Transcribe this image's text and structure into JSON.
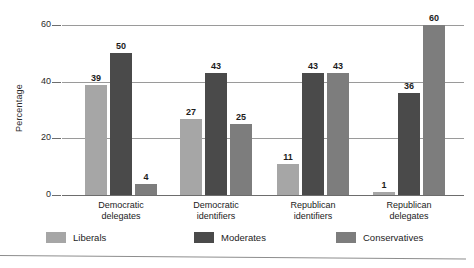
{
  "chart_data": {
    "type": "bar",
    "title": "",
    "xlabel": "",
    "ylabel": "Percentage",
    "ylim": [
      0,
      60
    ],
    "yticks": [
      "0",
      "20",
      "40",
      "60"
    ],
    "ytick_values": [
      0,
      20,
      40,
      60
    ],
    "grid": true,
    "legend_position": "bottom",
    "categories": [
      "Democratic delegates",
      "Democratic identifiers",
      "Republican identifiers",
      "Republican delegates"
    ],
    "category_lines": [
      [
        "Democratic",
        "delegates"
      ],
      [
        "Democratic",
        "identifiers"
      ],
      [
        "Republican",
        "identifiers"
      ],
      [
        "Republican",
        "delegates"
      ]
    ],
    "series": [
      {
        "name": "Liberals",
        "color": "#a6a6a6",
        "values": [
          39,
          27,
          11,
          1
        ]
      },
      {
        "name": "Moderates",
        "color": "#4a4a4a",
        "values": [
          50,
          43,
          43,
          36
        ]
      },
      {
        "name": "Conservatives",
        "color": "#7d7d7d",
        "values": [
          4,
          25,
          43,
          60
        ]
      }
    ]
  },
  "legend": {
    "items": [
      {
        "label": "Liberals"
      },
      {
        "label": "Moderates"
      },
      {
        "label": "Conservatives"
      }
    ]
  },
  "axis": {
    "y_title": "Percentage"
  }
}
